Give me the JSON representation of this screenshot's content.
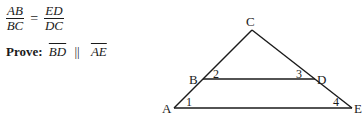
{
  "given": {
    "left": {
      "numerator": "AB",
      "denominator": "BC"
    },
    "operator": "=",
    "right": {
      "numerator": "ED",
      "denominator": "DC"
    }
  },
  "prove": {
    "label": "Prove:",
    "segment1": "BD",
    "relation": "||",
    "segment2": "AE"
  },
  "diagram": {
    "points": {
      "A": {
        "label": "A",
        "x": 174,
        "y": 108
      },
      "B": {
        "label": "B",
        "x": 203,
        "y": 79
      },
      "C": {
        "label": "C",
        "x": 252,
        "y": 30
      },
      "D": {
        "label": "D",
        "x": 315,
        "y": 79
      },
      "E": {
        "label": "E",
        "x": 352,
        "y": 108
      }
    },
    "angles": {
      "1": "1",
      "2": "2",
      "3": "3",
      "4": "4"
    },
    "line_color": "#1a1a1a"
  }
}
